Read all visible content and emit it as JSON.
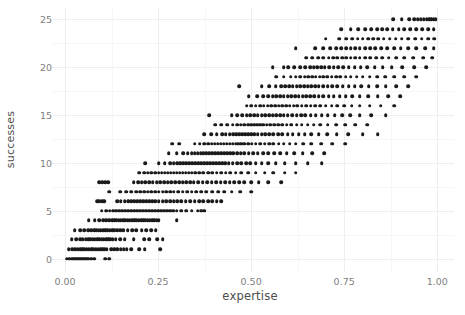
{
  "chart_data": {
    "type": "scatter",
    "title": "",
    "xlabel": "expertise",
    "ylabel": "successes",
    "xlim": [
      -0.035,
      1.045
    ],
    "ylim": [
      -1.4,
      26.2
    ],
    "xticks": [
      0.0,
      0.25,
      0.5,
      0.75,
      1.0
    ],
    "xticklabels": [
      "0.00",
      "0.25",
      "0.50",
      "0.75",
      "1.00"
    ],
    "yticks": [
      0,
      5,
      10,
      15,
      20,
      25
    ],
    "yticklabels": [
      "0",
      "5",
      "10",
      "15",
      "20",
      "25"
    ],
    "x_minor_ticks": [
      0.125,
      0.375,
      0.625,
      0.875
    ],
    "y_minor_ticks": [
      2.5,
      7.5,
      12.5,
      17.5,
      22.5
    ],
    "grid": true,
    "legend": null,
    "point_color": "#1a1a1a",
    "point_size": 3.6,
    "panel_background": "#ffffff",
    "grid_major_color": "#eceff1",
    "grid_minor_color": "#f6f7f8",
    "axis_text_color": "#808080",
    "axis_title_color": "#4d4d4d",
    "n_points": 1000,
    "rows": [
      {
        "y": 0,
        "x": [
          0.005,
          0.012,
          0.018,
          0.022,
          0.026,
          0.03,
          0.034,
          0.038,
          0.042,
          0.046,
          0.05,
          0.054,
          0.058,
          0.062,
          0.07,
          0.078,
          0.108,
          0.118
        ]
      },
      {
        "y": 1,
        "x": [
          0.01,
          0.02,
          0.028,
          0.034,
          0.04,
          0.046,
          0.052,
          0.058,
          0.064,
          0.07,
          0.076,
          0.082,
          0.088,
          0.094,
          0.1,
          0.106,
          0.112,
          0.124,
          0.132,
          0.14,
          0.15,
          0.158,
          0.166,
          0.178,
          0.2,
          0.214,
          0.256
        ]
      },
      {
        "y": 2,
        "x": [
          0.018,
          0.03,
          0.04,
          0.048,
          0.056,
          0.062,
          0.068,
          0.074,
          0.08,
          0.086,
          0.092,
          0.098,
          0.104,
          0.11,
          0.116,
          0.122,
          0.128,
          0.136,
          0.148,
          0.16,
          0.184,
          0.212,
          0.226,
          0.248,
          0.262
        ]
      },
      {
        "y": 3,
        "x": [
          0.026,
          0.04,
          0.052,
          0.062,
          0.07,
          0.078,
          0.084,
          0.09,
          0.096,
          0.102,
          0.108,
          0.114,
          0.12,
          0.126,
          0.132,
          0.14,
          0.148,
          0.156,
          0.168,
          0.18,
          0.192,
          0.206,
          0.218,
          0.232,
          0.244
        ]
      },
      {
        "y": 4,
        "x": [
          0.064,
          0.08,
          0.092,
          0.102,
          0.11,
          0.118,
          0.126,
          0.132,
          0.138,
          0.144,
          0.15,
          0.156,
          0.162,
          0.168,
          0.174,
          0.18,
          0.186,
          0.192,
          0.198,
          0.204,
          0.21,
          0.216,
          0.222,
          0.228,
          0.234,
          0.24,
          0.246,
          0.252,
          0.3
        ]
      },
      {
        "y": 5,
        "x": [
          0.098,
          0.11,
          0.12,
          0.13,
          0.138,
          0.146,
          0.154,
          0.162,
          0.17,
          0.178,
          0.186,
          0.194,
          0.202,
          0.21,
          0.218,
          0.226,
          0.234,
          0.242,
          0.25,
          0.258,
          0.266,
          0.274,
          0.282,
          0.29,
          0.3,
          0.312,
          0.326,
          0.34,
          0.356,
          0.366,
          0.374
        ]
      },
      {
        "y": 6,
        "x": [
          0.086,
          0.092,
          0.1,
          0.106,
          0.14,
          0.15,
          0.16,
          0.17,
          0.178,
          0.186,
          0.194,
          0.202,
          0.21,
          0.218,
          0.226,
          0.234,
          0.242,
          0.252,
          0.262,
          0.272,
          0.282,
          0.292,
          0.302,
          0.312,
          0.324,
          0.336,
          0.348,
          0.36,
          0.372,
          0.384,
          0.396,
          0.408,
          0.42
        ]
      },
      {
        "y": 7,
        "x": [
          0.118,
          0.148,
          0.164,
          0.178,
          0.192,
          0.202,
          0.212,
          0.222,
          0.232,
          0.242,
          0.252,
          0.262,
          0.272,
          0.282,
          0.292,
          0.304,
          0.316,
          0.328,
          0.34,
          0.352,
          0.366,
          0.38,
          0.396,
          0.412,
          0.428,
          0.448,
          0.47,
          0.5
        ]
      },
      {
        "y": 8,
        "x": [
          0.092,
          0.1,
          0.108,
          0.116,
          0.184,
          0.196,
          0.206,
          0.216,
          0.226,
          0.236,
          0.246,
          0.256,
          0.266,
          0.276,
          0.286,
          0.296,
          0.306,
          0.316,
          0.326,
          0.336,
          0.346,
          0.358,
          0.37,
          0.382,
          0.394,
          0.406,
          0.418,
          0.43,
          0.442,
          0.454,
          0.468,
          0.482,
          0.5,
          0.52,
          0.546,
          0.58
        ]
      },
      {
        "y": 9,
        "x": [
          0.2,
          0.212,
          0.222,
          0.232,
          0.242,
          0.252,
          0.26,
          0.268,
          0.276,
          0.284,
          0.292,
          0.3,
          0.308,
          0.316,
          0.324,
          0.332,
          0.34,
          0.35,
          0.36,
          0.372,
          0.384,
          0.396,
          0.408,
          0.42,
          0.432,
          0.444,
          0.458,
          0.474,
          0.492,
          0.512,
          0.536,
          0.56,
          0.59,
          0.62
        ]
      },
      {
        "y": 10,
        "x": [
          0.216,
          0.252,
          0.268,
          0.282,
          0.292,
          0.302,
          0.31,
          0.318,
          0.326,
          0.334,
          0.342,
          0.35,
          0.358,
          0.366,
          0.374,
          0.382,
          0.39,
          0.398,
          0.406,
          0.414,
          0.422,
          0.43,
          0.44,
          0.45,
          0.462,
          0.474,
          0.486,
          0.498,
          0.512,
          0.528,
          0.546,
          0.566,
          0.59,
          0.62,
          0.652,
          0.69
        ]
      },
      {
        "y": 11,
        "x": [
          0.278,
          0.3,
          0.318,
          0.33,
          0.34,
          0.348,
          0.356,
          0.364,
          0.372,
          0.38,
          0.388,
          0.396,
          0.404,
          0.412,
          0.42,
          0.428,
          0.436,
          0.444,
          0.452,
          0.462,
          0.472,
          0.482,
          0.494,
          0.506,
          0.518,
          0.532,
          0.546,
          0.562,
          0.578,
          0.596,
          0.616,
          0.638,
          0.664,
          0.696
        ]
      },
      {
        "y": 12,
        "x": [
          0.288,
          0.306,
          0.348,
          0.362,
          0.374,
          0.384,
          0.394,
          0.402,
          0.41,
          0.418,
          0.426,
          0.434,
          0.442,
          0.45,
          0.458,
          0.466,
          0.474,
          0.482,
          0.492,
          0.502,
          0.512,
          0.524,
          0.536,
          0.548,
          0.56,
          0.574,
          0.588,
          0.604,
          0.62,
          0.64,
          0.662,
          0.688,
          0.718,
          0.752
        ]
      },
      {
        "y": 13,
        "x": [
          0.374,
          0.392,
          0.408,
          0.422,
          0.432,
          0.442,
          0.452,
          0.46,
          0.468,
          0.476,
          0.484,
          0.492,
          0.5,
          0.508,
          0.518,
          0.528,
          0.538,
          0.548,
          0.56,
          0.572,
          0.584,
          0.598,
          0.612,
          0.628,
          0.644,
          0.662,
          0.682,
          0.704,
          0.73,
          0.76,
          0.8,
          0.84
        ]
      },
      {
        "y": 14,
        "x": [
          0.404,
          0.42,
          0.436,
          0.45,
          0.462,
          0.472,
          0.482,
          0.492,
          0.5,
          0.508,
          0.516,
          0.524,
          0.532,
          0.542,
          0.552,
          0.562,
          0.572,
          0.584,
          0.596,
          0.608,
          0.622,
          0.636,
          0.652,
          0.668,
          0.686,
          0.706,
          0.728,
          0.752,
          0.78,
          0.812
        ]
      },
      {
        "y": 15,
        "x": [
          0.388,
          0.448,
          0.462,
          0.476,
          0.488,
          0.498,
          0.508,
          0.518,
          0.528,
          0.538,
          0.548,
          0.558,
          0.568,
          0.578,
          0.588,
          0.598,
          0.61,
          0.622,
          0.634,
          0.646,
          0.66,
          0.674,
          0.69,
          0.706,
          0.724,
          0.744,
          0.766,
          0.792,
          0.822,
          0.862
        ]
      },
      {
        "y": 16,
        "x": [
          0.488,
          0.5,
          0.512,
          0.524,
          0.534,
          0.544,
          0.554,
          0.564,
          0.574,
          0.584,
          0.594,
          0.604,
          0.614,
          0.624,
          0.636,
          0.648,
          0.66,
          0.672,
          0.686,
          0.7,
          0.716,
          0.732,
          0.75,
          0.77,
          0.792,
          0.818,
          0.848,
          0.884
        ]
      },
      {
        "y": 17,
        "x": [
          0.494,
          0.516,
          0.532,
          0.546,
          0.558,
          0.568,
          0.578,
          0.588,
          0.598,
          0.608,
          0.618,
          0.628,
          0.638,
          0.648,
          0.658,
          0.67,
          0.682,
          0.694,
          0.708,
          0.722,
          0.738,
          0.754,
          0.772,
          0.792,
          0.814,
          0.84,
          0.868,
          0.9
        ]
      },
      {
        "y": 18,
        "x": [
          0.468,
          0.528,
          0.548,
          0.566,
          0.58,
          0.592,
          0.602,
          0.612,
          0.622,
          0.632,
          0.642,
          0.652,
          0.662,
          0.672,
          0.682,
          0.694,
          0.706,
          0.718,
          0.732,
          0.746,
          0.762,
          0.778,
          0.796,
          0.816,
          0.838,
          0.862,
          0.89,
          0.922
        ]
      },
      {
        "y": 19,
        "x": [
          0.568,
          0.588,
          0.606,
          0.62,
          0.632,
          0.644,
          0.654,
          0.664,
          0.674,
          0.684,
          0.694,
          0.704,
          0.716,
          0.728,
          0.74,
          0.754,
          0.768,
          0.784,
          0.8,
          0.818,
          0.838,
          0.86,
          0.884,
          0.912,
          0.944
        ]
      },
      {
        "y": 20,
        "x": [
          0.558,
          0.588,
          0.6,
          0.616,
          0.632,
          0.646,
          0.658,
          0.668,
          0.678,
          0.688,
          0.698,
          0.71,
          0.722,
          0.734,
          0.748,
          0.762,
          0.778,
          0.794,
          0.812,
          0.832,
          0.854,
          0.878,
          0.906,
          0.938,
          0.97
        ]
      },
      {
        "y": 21,
        "x": [
          0.648,
          0.664,
          0.68,
          0.694,
          0.708,
          0.72,
          0.732,
          0.744,
          0.756,
          0.768,
          0.78,
          0.792,
          0.806,
          0.82,
          0.836,
          0.852,
          0.87,
          0.89,
          0.912,
          0.936,
          0.962,
          0.986
        ]
      },
      {
        "y": 22,
        "x": [
          0.62,
          0.672,
          0.694,
          0.712,
          0.728,
          0.742,
          0.756,
          0.768,
          0.78,
          0.792,
          0.806,
          0.82,
          0.834,
          0.85,
          0.866,
          0.884,
          0.902,
          0.922,
          0.944,
          0.968,
          0.99
        ]
      },
      {
        "y": 23,
        "x": [
          0.7,
          0.736,
          0.756,
          0.772,
          0.786,
          0.8,
          0.814,
          0.828,
          0.842,
          0.856,
          0.872,
          0.888,
          0.904,
          0.922,
          0.94,
          0.958,
          0.976,
          0.992
        ]
      },
      {
        "y": 24,
        "x": [
          0.742,
          0.768,
          0.788,
          0.806,
          0.822,
          0.838,
          0.852,
          0.866,
          0.88,
          0.896,
          0.912,
          0.928,
          0.944,
          0.96,
          0.976,
          0.99
        ]
      },
      {
        "y": 25,
        "x": [
          0.882,
          0.904,
          0.924,
          0.938,
          0.948,
          0.956,
          0.964,
          0.972,
          0.978,
          0.984,
          0.99,
          0.996
        ]
      }
    ]
  }
}
